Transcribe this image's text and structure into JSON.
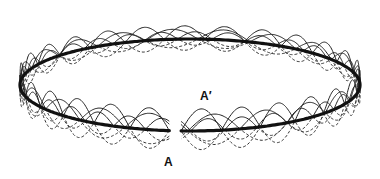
{
  "figure": {
    "labels": {
      "a": "A",
      "a_prime": "A′"
    },
    "colors": {
      "ring": "#111111",
      "wave_solid": "#222222",
      "wave_dashed": "#333333",
      "background": "#ffffff"
    },
    "ring": {
      "cx": 190,
      "cy": 85,
      "rx": 170,
      "ry": 46,
      "gap_start_deg": 93,
      "gap_end_deg": 97
    },
    "waves": {
      "solid_count": 3,
      "dashed_count": 3,
      "amplitude": 22
    }
  }
}
